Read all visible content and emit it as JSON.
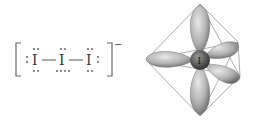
{
  "lewis_structure": {
    "atoms": [
      "I",
      "I",
      "I"
    ],
    "charge": "−",
    "lone_pairs": {
      "terminal": 3,
      "central": 3
    }
  },
  "orbital_diagram": {
    "central_atom": "I",
    "geometry": "octahedral",
    "lobes": 5
  }
}
